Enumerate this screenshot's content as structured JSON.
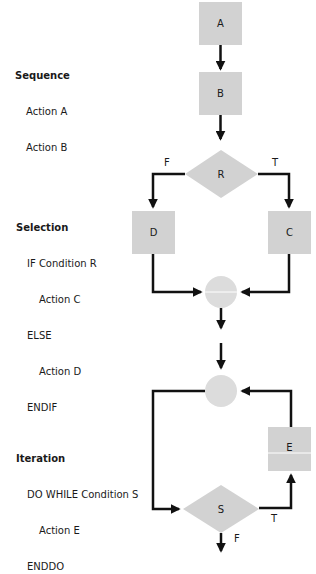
{
  "colors": {
    "node_fill": "#d2d2d2",
    "connector_fill": "#dcdcdc",
    "line": "#111111",
    "text": "#1a1a1a"
  },
  "sections": {
    "sequence": {
      "title": "Sequence",
      "lines": [
        "Action A",
        "Action B"
      ]
    },
    "selection": {
      "title": "Selection",
      "lines": [
        "IF Condition R",
        "Action C",
        "ELSE",
        "Action D",
        "ENDIF"
      ]
    },
    "iteration": {
      "title": "Iteration",
      "lines": [
        "DO WHILE Condition S",
        "Action E",
        "ENDDO"
      ]
    }
  },
  "nodes": {
    "A": "A",
    "B": "B",
    "R": "R",
    "C": "C",
    "D": "D",
    "E": "E",
    "S": "S"
  },
  "edge_labels": {
    "r_false": "F",
    "r_true": "T",
    "s_true": "T",
    "s_false": "F"
  }
}
